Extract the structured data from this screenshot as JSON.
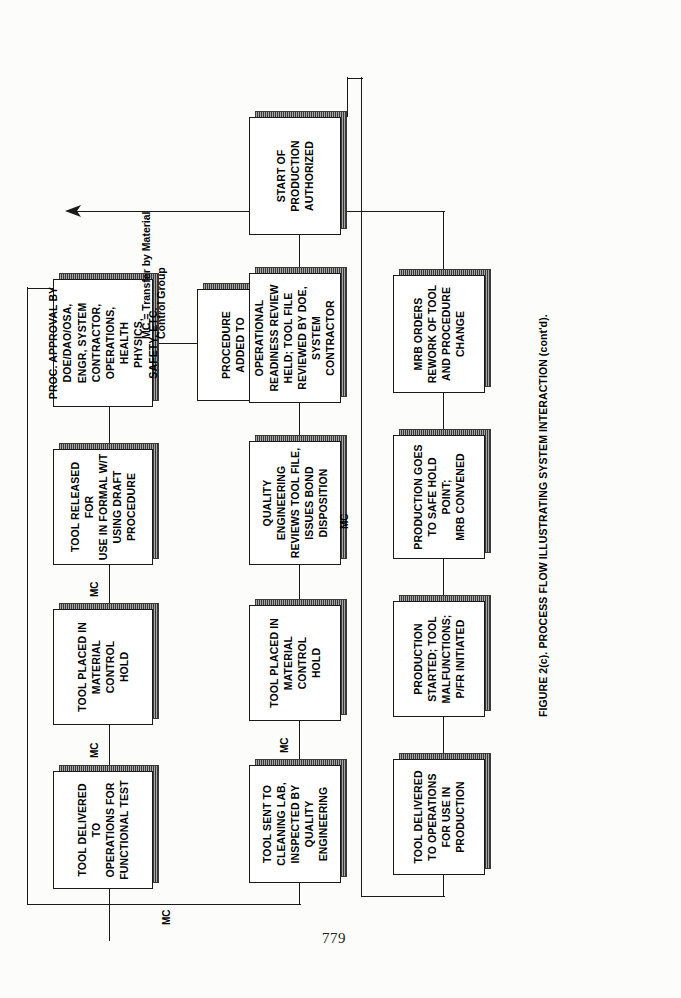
{
  "document": {
    "page_number": "779",
    "figure_caption": "FIGURE 2(c).  PROCESS FLOW ILLUSTRATING SYSTEM INTERACTION (cont'd).",
    "legend": "MC = Transfer by Material\nControl Group",
    "connector_label": "MC"
  },
  "flowchart": {
    "type": "process-flow",
    "rows": [
      {
        "id": "row-1",
        "nodes": [
          {
            "id": "n1",
            "text": "TOOL DELIVERED TO\nOPERATIONS FOR\nFUNCTIONAL TEST"
          },
          {
            "id": "n2",
            "text": "TOOL PLACED IN\nMATERIAL CONTROL\nHOLD"
          },
          {
            "id": "n3",
            "text": "TOOL RELEASED FOR\nUSE IN FORMAL W/T\nUSING DRAFT\nPROCEDURE"
          },
          {
            "id": "n4",
            "text": "PROC. APPROVAL BY\nDOE/DAO/OSA,\nENGR, SYSTEM\nCONTRACTOR,\nOPERATIONS,\nHEALTH\nPHYSICS,\nSAFETY, ETC."
          }
        ],
        "branch": {
          "id": "n5",
          "text": "PROCEDURE\nADDED TO\nPRODUCT INDEX"
        }
      },
      {
        "id": "row-2",
        "nodes": [
          {
            "id": "n6",
            "text": "TOOL SENT TO\nCLEANING LAB,\nINSPECTED BY\nQUALITY ENGINEERING"
          },
          {
            "id": "n7",
            "text": "TOOL PLACED IN\nMATERIAL CONTROL\nHOLD"
          },
          {
            "id": "n8",
            "text": "QUALITY ENGINEERING\nREVIEWS TOOL FILE,\nISSUES BOND\nDISPOSITION"
          },
          {
            "id": "n9",
            "text": "OPERATIONAL\nREADINESS REVIEW\nHELD; TOOL FILE\nREVIEWED BY DOE,\nSYSTEM CONTRACTOR"
          },
          {
            "id": "n10",
            "text": "START OF\nPRODUCTION\nAUTHORIZED"
          }
        ]
      },
      {
        "id": "row-3",
        "nodes": [
          {
            "id": "n11",
            "text": "TOOL DELIVERED\nTO OPERATIONS\nFOR USE IN\nPRODUCTION"
          },
          {
            "id": "n12",
            "text": "PRODUCTION\nSTARTED; TOOL\nMALFUNCTIONS;\nP/FR INITIATED"
          },
          {
            "id": "n13",
            "text": "PRODUCTION GOES\nTO SAFE HOLD POINT;\nMRB CONVENED"
          },
          {
            "id": "n14",
            "text": "MRB ORDERS\nREWORK OF TOOL\nAND PROCEDURE\nCHANGE"
          }
        ]
      }
    ],
    "inline_mc_labels": [
      {
        "id": "mc-a",
        "text": "MC"
      },
      {
        "id": "mc-b",
        "text": "MC"
      },
      {
        "id": "mc-c",
        "text": "MC"
      },
      {
        "id": "mc-d",
        "text": "MC"
      },
      {
        "id": "mc-wrap-1",
        "text": "MC"
      },
      {
        "id": "mc-wrap-2",
        "text": "MC"
      }
    ],
    "colors": {
      "stroke": "#1a1a1a",
      "node_fill": "#ffffff",
      "shadow": "#7a7a7a",
      "page": "#fcfcfa"
    }
  }
}
